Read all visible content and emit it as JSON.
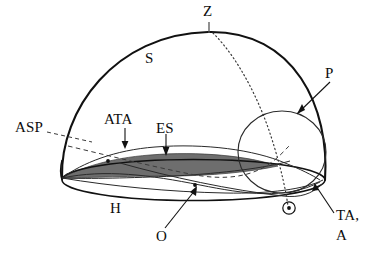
{
  "figure": {
    "kind": "astronomical-dome-diagram",
    "background_color": "#ffffff",
    "stroke_color": "#111111",
    "shade_color": "#6e6e6e",
    "thin_stroke_color": "#2a2a2a"
  },
  "labels": {
    "zenith": "Z",
    "sphere": "S",
    "pole_circle": "P",
    "altitude_sun_path": "ASP",
    "ata_curve": "ATA",
    "equinox_strip": "ES",
    "horizon": "H",
    "observer": "O",
    "ta_a_line1": "TA,",
    "ta_a_line2": "A"
  },
  "icons": {
    "sun_symbol": "sun-circle-dot-icon",
    "zenith_tick": "zenith-tick-icon"
  },
  "annotations": {
    "arrow_targets": [
      {
        "name": "P",
        "note": "arrow points down-left to top of small circle"
      },
      {
        "name": "ATA",
        "note": "arrow points down to upper thin arc"
      },
      {
        "name": "ES",
        "note": "arrow points down to shaded lens band"
      },
      {
        "name": "O",
        "note": "arrow points up-right to marked point on horizon"
      },
      {
        "name": "TA, A",
        "note": "leader line points up-left to right rim of horizon ellipse"
      },
      {
        "name": "ASP",
        "note": "dashed leader runs right, down across the interior"
      },
      {
        "name": "Z",
        "note": "short vertical tick down to dome apex"
      }
    ],
    "line_styles": {
      "meridian": "dotted",
      "asp_ray": "dashed",
      "dome_outline": "solid",
      "horizon": "solid"
    }
  }
}
